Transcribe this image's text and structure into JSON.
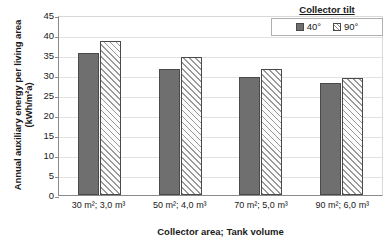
{
  "chart_data": {
    "type": "bar",
    "title": "",
    "xlabel": "Collector area; Tank volume",
    "ylabel": "Annual auxiliary energy per living area (kWh/m²a)",
    "categories": [
      "30 m²; 3,0 m³",
      "50 m²; 4,0 m³",
      "70 m²; 5,0 m³",
      "90 m²; 6,0 m³"
    ],
    "series": [
      {
        "name": "40°",
        "values": [
          35.5,
          31.4,
          29.5,
          28.1
        ],
        "style": "solid",
        "color": "#6f6f6f"
      },
      {
        "name": "90°",
        "values": [
          38.5,
          34.4,
          31.5,
          29.2
        ],
        "style": "hatched",
        "color": "#fbfbfb"
      }
    ],
    "ylim": [
      0,
      45
    ],
    "ytick_values": [
      0,
      5,
      10,
      15,
      20,
      25,
      30,
      35,
      40,
      45
    ],
    "ytick_labels": [
      "0",
      "5",
      "10",
      "15",
      "20",
      "25",
      "30",
      "35",
      "40",
      "45"
    ],
    "grid": true,
    "legend": {
      "title": "Collector tilt",
      "position": "top-right",
      "entries": [
        "40°",
        "90°"
      ]
    }
  }
}
